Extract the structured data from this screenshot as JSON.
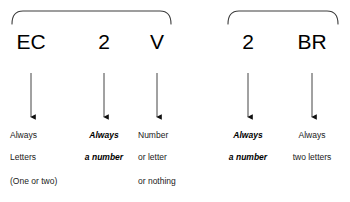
{
  "diagram": {
    "background_color": "#ffffff",
    "line_color": "#3c3c3c",
    "text_color": "#1a1a1a",
    "groups": [
      {
        "name": "left-group",
        "brace": {
          "x_start": 12,
          "x_end": 171,
          "y_top": 11,
          "y_bottom": 24
        }
      },
      {
        "name": "right-group",
        "brace": {
          "x_start": 228,
          "x_end": 338,
          "y_top": 11,
          "y_bottom": 24
        }
      }
    ],
    "columns": [
      {
        "id": "col-ec",
        "token": "EC",
        "token_x": 31,
        "arrow_x": 31,
        "align": "left",
        "text_x": 10,
        "lines": [
          {
            "text": "Always",
            "emphasis": false
          },
          {
            "text": "Letters",
            "emphasis": false
          },
          {
            "text": "(One or two)",
            "emphasis": false
          }
        ]
      },
      {
        "id": "col-2-left",
        "token": "2",
        "token_x": 104,
        "arrow_x": 104,
        "align": "center",
        "text_x": 104,
        "lines": [
          {
            "text": "Always",
            "emphasis": true
          },
          {
            "text": "a number",
            "emphasis": true
          }
        ]
      },
      {
        "id": "col-v",
        "token": "V",
        "token_x": 157,
        "arrow_x": 157,
        "align": "left",
        "text_x": 138,
        "lines": [
          {
            "text": "Number",
            "emphasis": false
          },
          {
            "text": "or letter",
            "emphasis": false
          },
          {
            "text": "or nothing",
            "emphasis": false
          }
        ]
      },
      {
        "id": "col-2-right",
        "token": "2",
        "token_x": 248,
        "arrow_x": 248,
        "align": "center",
        "text_x": 248,
        "lines": [
          {
            "text": "Always",
            "emphasis": true
          },
          {
            "text": "a number",
            "emphasis": true
          }
        ]
      },
      {
        "id": "col-br",
        "token": "BR",
        "token_x": 312,
        "arrow_x": 312,
        "align": "center",
        "text_x": 312,
        "lines": [
          {
            "text": "Always",
            "emphasis": false
          },
          {
            "text": "two letters",
            "emphasis": false
          }
        ]
      }
    ],
    "geometry": {
      "token_baseline_y": 46,
      "arrow_top_y": 73,
      "arrow_bottom_y": 117,
      "line_y": [
        131,
        153,
        177
      ]
    }
  }
}
